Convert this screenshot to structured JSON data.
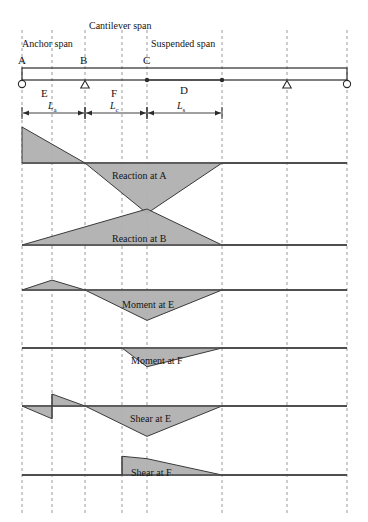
{
  "figure": {
    "title_spans": [
      {
        "id": "cantilever",
        "label": "Cantilever span",
        "x": 89,
        "y": 21
      },
      {
        "id": "anchor",
        "label": "Anchor span",
        "x": 22,
        "y": 39
      },
      {
        "id": "suspended",
        "label": "Suspended span",
        "x": 151,
        "y": 39
      }
    ],
    "point_labels": [
      {
        "id": "A",
        "label": "A",
        "x": 18,
        "y": 55
      },
      {
        "id": "B",
        "label": "B",
        "x": 80,
        "y": 55
      },
      {
        "id": "C",
        "label": "C",
        "x": 143,
        "y": 55
      },
      {
        "id": "D",
        "label": "D",
        "x": 180,
        "y": 85
      },
      {
        "id": "E",
        "label": "E",
        "x": 41,
        "y": 88
      },
      {
        "id": "F",
        "label": "F",
        "x": 111,
        "y": 88
      }
    ],
    "dimensions": [
      {
        "id": "La",
        "symbol": "L",
        "sub": "a",
        "x0": 22,
        "x1": 85,
        "label_x": 48,
        "y": 113
      },
      {
        "id": "Lc",
        "symbol": "L",
        "sub": "c",
        "x0": 85,
        "x1": 147,
        "label_x": 110,
        "y": 113
      },
      {
        "id": "Ls",
        "symbol": "L",
        "sub": "s",
        "x0": 147,
        "x1": 222,
        "label_x": 177,
        "y": 113
      }
    ],
    "gridlines_x": [
      22,
      52,
      85,
      122,
      147,
      222,
      287,
      347
    ],
    "beam": {
      "x_left": 22,
      "x_right": 347,
      "y_top": 68,
      "y_bottom": 80,
      "supports": [
        {
          "id": "support-A",
          "type": "pin-circle",
          "x": 22
        },
        {
          "id": "support-B",
          "type": "roller-triangle",
          "x": 85
        },
        {
          "id": "support-right-roller",
          "type": "roller-triangle",
          "x": 287
        },
        {
          "id": "support-right-end",
          "type": "pin-circle",
          "x": 347
        }
      ],
      "hinges": [
        {
          "id": "hinge-C",
          "x": 147
        },
        {
          "id": "hinge-suspended",
          "x": 222
        }
      ]
    },
    "colors": {
      "fill": "#b0b0b0",
      "stroke": "#3a3a3a",
      "grid": "#9a9a9a",
      "beam": "#2b2b2b"
    }
  },
  "chart_data": {
    "type": "line",
    "xlabel": "Position along beam",
    "ylabel": "Influence ordinate",
    "grid": true,
    "legend": "none",
    "x_stations": {
      "A": 22,
      "E": 52,
      "B": 85,
      "F": 122,
      "C": 147,
      "hinge": 222,
      "roller": 287,
      "end": 347
    },
    "panels": [
      {
        "id": "reaction-at-A",
        "label": "Reaction at A",
        "label_x": 112,
        "label_y": 171,
        "baseline_y": 163,
        "baseline_x0": 22,
        "baseline_x1": 347,
        "points": [
          [
            22,
            1.0
          ],
          [
            85,
            0.0
          ],
          [
            147,
            -1.2
          ],
          [
            222,
            0.0
          ],
          [
            347,
            0.0
          ]
        ],
        "pos_peak_px": 36,
        "neg_peak_px": 42
      },
      {
        "id": "reaction-at-B",
        "label": "Reaction at B",
        "label_x": 112,
        "label_y": 234,
        "baseline_y": 245,
        "baseline_x0": 22,
        "baseline_x1": 347,
        "points": [
          [
            22,
            0.0
          ],
          [
            147,
            1.0
          ],
          [
            222,
            0.0
          ],
          [
            347,
            0.0
          ]
        ],
        "pos_peak_px": 36,
        "neg_peak_px": 0
      },
      {
        "id": "moment-at-E",
        "label": "Moment at E",
        "label_x": 122,
        "label_y": 300,
        "baseline_y": 290,
        "baseline_x0": 22,
        "baseline_x1": 347,
        "points": [
          [
            22,
            0.0
          ],
          [
            52,
            0.55
          ],
          [
            85,
            0.0
          ],
          [
            147,
            -0.95
          ],
          [
            222,
            0.0
          ],
          [
            347,
            0.0
          ]
        ],
        "pos_peak_px": 18,
        "neg_peak_px": 32
      },
      {
        "id": "moment-at-F",
        "label": "Moment at F",
        "label_x": 131,
        "label_y": 356,
        "baseline_y": 348,
        "baseline_x0": 22,
        "baseline_x1": 347,
        "points": [
          [
            22,
            0.0
          ],
          [
            122,
            0.0
          ],
          [
            147,
            -0.72
          ],
          [
            222,
            0.0
          ],
          [
            347,
            0.0
          ]
        ],
        "pos_peak_px": 0,
        "neg_peak_px": 26
      },
      {
        "id": "shear-at-E",
        "label": "Shear at E",
        "label_x": 130,
        "label_y": 414,
        "baseline_y": 406,
        "baseline_x0": 22,
        "baseline_x1": 347,
        "points": [
          [
            22,
            0.0
          ],
          [
            52,
            -0.4
          ],
          [
            52,
            0.6
          ],
          [
            85,
            0.0
          ],
          [
            147,
            -0.95
          ],
          [
            222,
            0.0
          ],
          [
            347,
            0.0
          ]
        ],
        "discontinuity_at": 52,
        "pos_peak_px": 20,
        "neg_peak_px": 32
      },
      {
        "id": "shear-at-F",
        "label": "Shear at F",
        "label_x": 131,
        "label_y": 468,
        "baseline_y": 475,
        "baseline_x0": 22,
        "baseline_x1": 347,
        "points": [
          [
            22,
            0.0
          ],
          [
            122,
            0.0
          ],
          [
            122,
            0.78
          ],
          [
            147,
            0.68
          ],
          [
            222,
            0.0
          ],
          [
            347,
            0.0
          ]
        ],
        "discontinuity_at": 122,
        "pos_peak_px": 24,
        "neg_peak_px": 0
      }
    ]
  }
}
